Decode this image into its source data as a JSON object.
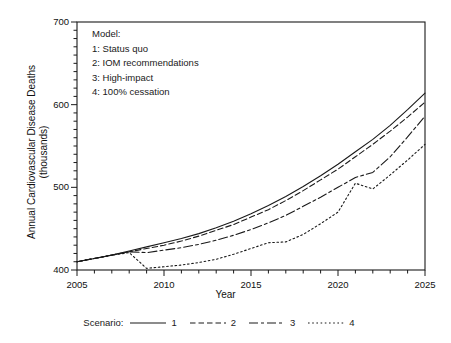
{
  "chart_data": {
    "type": "line",
    "title": "",
    "xlabel": "Year",
    "ylabel": "Annual Cardiovascular Disease Deaths (thousands)",
    "ylabel_line1": "Annual Cardiovascular Disease Deaths",
    "ylabel_line2": "(thousands)",
    "xlim": [
      2005,
      2025
    ],
    "ylim": [
      400,
      700
    ],
    "xticks": [
      2005,
      2010,
      2015,
      2020,
      2025
    ],
    "xtick_labels": [
      "2005",
      "2010",
      "2015",
      "2020",
      "2025"
    ],
    "yticks": [
      400,
      500,
      600,
      700
    ],
    "ytick_labels": [
      "400",
      "500",
      "600",
      "700"
    ],
    "x_minor_tick_step": 1,
    "y_minor_tick_step": 10,
    "grid": false,
    "legend_position": "bottom",
    "x": [
      2005,
      2006,
      2007,
      2008,
      2009,
      2010,
      2011,
      2012,
      2013,
      2014,
      2015,
      2016,
      2017,
      2018,
      2019,
      2020,
      2021,
      2022,
      2023,
      2024,
      2025
    ],
    "series": [
      {
        "name": "1",
        "label": "Status quo",
        "line_style": "solid",
        "values": [
          410,
          414,
          418,
          423,
          428,
          433,
          438,
          444,
          451,
          459,
          468,
          478,
          489,
          501,
          514,
          528,
          543,
          558,
          575,
          594,
          614
        ]
      },
      {
        "name": "2",
        "label": "IOM recommendations",
        "line_style": "dashed",
        "values": [
          410,
          414,
          418,
          422,
          426,
          430,
          435,
          441,
          448,
          455,
          464,
          473,
          484,
          496,
          509,
          522,
          537,
          552,
          568,
          585,
          603
        ]
      },
      {
        "name": "3",
        "label": "High-impact",
        "line_style": "long-dash",
        "values": [
          410,
          414,
          418,
          422,
          421,
          424,
          427,
          431,
          436,
          442,
          449,
          457,
          466,
          477,
          488,
          500,
          512,
          518,
          537,
          561,
          586
        ]
      },
      {
        "name": "4",
        "label": "100% cessation",
        "line_style": "dotted",
        "values": [
          410,
          414,
          418,
          421,
          402,
          404,
          406,
          409,
          413,
          419,
          426,
          433,
          434,
          443,
          456,
          470,
          505,
          498,
          515,
          533,
          552
        ]
      }
    ],
    "annotation": {
      "header": "Model:",
      "lines": [
        "1: Status quo",
        "2: IOM recommendations",
        "3: High-impact",
        "4: 100% cessation"
      ]
    },
    "legend": {
      "title": "Scenario:",
      "entries": [
        {
          "key": "1",
          "style": "solid"
        },
        {
          "key": "2",
          "style": "dashed"
        },
        {
          "key": "3",
          "style": "long-dash"
        },
        {
          "key": "4",
          "style": "dotted"
        }
      ]
    },
    "colors": {
      "line": "#1a1a1a",
      "axis": "#1a1a1a",
      "background": "#ffffff"
    }
  }
}
